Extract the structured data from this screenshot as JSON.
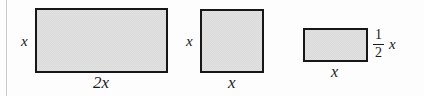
{
  "figure": {
    "background_color": "#fdfdfd",
    "shape_fill_color": "#d9d9d9",
    "shape_stroke_color": "#171717",
    "rule_color": "#c9c9c9",
    "shapes": [
      {
        "name": "wide-rectangle",
        "height_label": "x",
        "width_label": "2x"
      },
      {
        "name": "square",
        "height_label": "x",
        "width_label": "x"
      },
      {
        "name": "half-height-rectangle",
        "width_label": "x",
        "height_label_numerator": "1",
        "height_label_denominator": "2",
        "height_label_variable": "x"
      }
    ]
  }
}
